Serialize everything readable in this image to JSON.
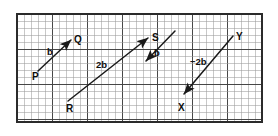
{
  "figure": {
    "kind": "vector-diagram-on-graph-paper",
    "background": "#ffffff",
    "ink_color": "#1a1a1a",
    "grid": {
      "x": 17,
      "y": 14,
      "width": 245,
      "height": 108,
      "minor_cell_px": 7,
      "major_every": 5,
      "minor_color": "#9a9a9a",
      "major_color": "#3d3d3d",
      "border_color": "#2b2b2b"
    },
    "points": [
      {
        "label": "P",
        "x": 32,
        "y": 72
      },
      {
        "label": "Q",
        "x": 74,
        "y": 35
      },
      {
        "label": "R",
        "x": 66,
        "y": 104
      },
      {
        "label": "S",
        "x": 152,
        "y": 33
      },
      {
        "label": "X",
        "x": 178,
        "y": 103
      },
      {
        "label": "Y",
        "x": 236,
        "y": 32
      }
    ],
    "vectors": [
      {
        "name": "PQ",
        "label": "b",
        "label_x": 47,
        "label_y": 47,
        "x1": 38,
        "y1": 71,
        "x2": 71,
        "y2": 40,
        "arrow_at": "end"
      },
      {
        "name": "RS",
        "label": "2b",
        "label_x": 96,
        "label_y": 60,
        "x1": 68,
        "y1": 101,
        "x2": 148,
        "y2": 38,
        "arrow_at": "end"
      },
      {
        "name": "b-down",
        "label": "b",
        "label_x": 154,
        "label_y": 48,
        "x1": 175,
        "y1": 31,
        "x2": 146,
        "y2": 61,
        "arrow_at": "end"
      },
      {
        "name": "YX",
        "label": "−2b",
        "label_x": 190,
        "label_y": 57,
        "x1": 233,
        "y1": 36,
        "x2": 184,
        "y2": 94,
        "arrow_at": "end"
      }
    ]
  }
}
